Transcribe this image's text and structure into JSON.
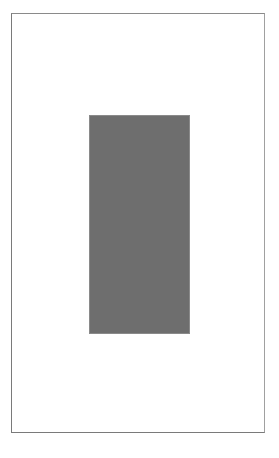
{
  "page": {
    "background_color": "#ffffff",
    "border_color": "#7a7a7a"
  },
  "placeholder": {
    "fill_color": "#6e6e6e",
    "label": ""
  }
}
